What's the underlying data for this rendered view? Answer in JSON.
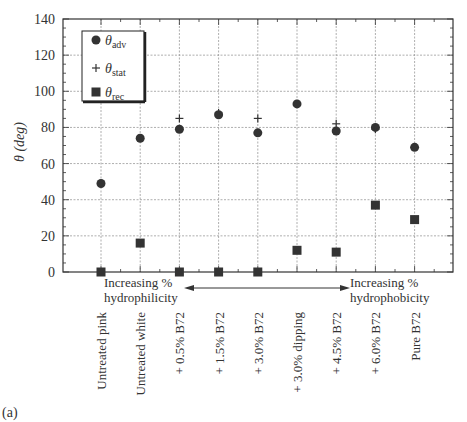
{
  "chart_data": {
    "type": "scatter",
    "title": "",
    "panel_label": "(a)",
    "xlabel": "",
    "ylabel": "θ (deg)",
    "ylim": [
      0,
      140
    ],
    "yticks": [
      0,
      20,
      40,
      60,
      80,
      100,
      120,
      140
    ],
    "grid": true,
    "legend_position": "top-left",
    "categories": [
      "Untreated pink",
      "Untreated white",
      "+ 0.5% B72",
      "+ 1.5% B72",
      "+ 3.0% B72",
      "+ 3.0% dipping",
      "+ 4.5% B72",
      "+ 6.0% B72",
      "Pure B72"
    ],
    "series": [
      {
        "name": "θadv",
        "symbol": "θ",
        "subscript": "adv",
        "marker": "circle",
        "values": [
          49,
          74,
          79,
          87,
          77,
          93,
          78,
          80,
          69
        ]
      },
      {
        "name": "θstat",
        "symbol": "θ",
        "subscript": "stat",
        "marker": "plus",
        "values": [
          null,
          null,
          85,
          88,
          85,
          null,
          82,
          79,
          null
        ]
      },
      {
        "name": "θrec",
        "symbol": "θ",
        "subscript": "rec",
        "marker": "square",
        "values": [
          0,
          16,
          0,
          0,
          0,
          12,
          11,
          37,
          29
        ]
      }
    ],
    "annotations": {
      "left_line1": "Increasing %",
      "left_line2": "hydrophilicity",
      "right_line1": "Increasing %",
      "right_line2": "hydrophobicity"
    },
    "colors": {
      "marker": "#333333",
      "grid": "#999999",
      "axis": "#333333"
    }
  }
}
